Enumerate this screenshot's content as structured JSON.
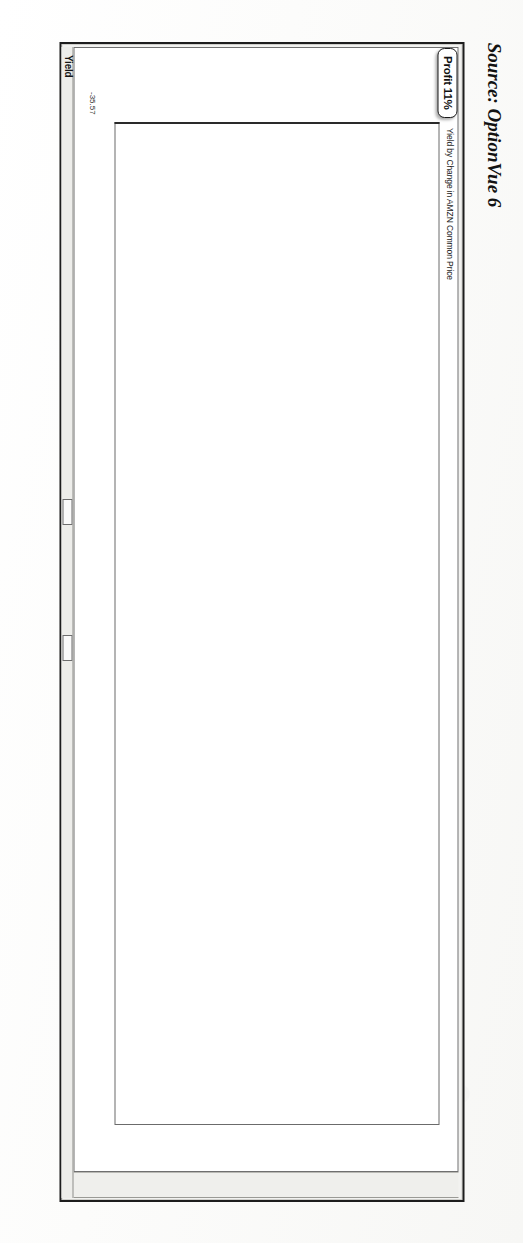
{
  "caption": {
    "source_text": "Source: OptionVue 6"
  },
  "window": {
    "yield_corner_label": "Yield",
    "y_axis_min_value": "-35.57"
  },
  "chart_data": {
    "type": "line",
    "title": "Yield by Change in AMZN Common Price",
    "xlabel": "",
    "ylabel": "Yield",
    "grid": true,
    "legend_position": "none",
    "x_tick_labels": [
      "128.81",
      "131.11",
      "133.42",
      "135.72",
      "138.02",
      "140.33",
      "142.63",
      "144.94",
      "147.24",
      "149.54",
      "151.85",
      "154.15",
      "156.46",
      "158.76",
      "161.06",
      "163.37",
      "165.67",
      "167.98",
      "170.28",
      "172.58",
      "174.89",
      "177.19"
    ],
    "x_secondary_tick_labels": [
      "-25%",
      "-18%",
      "-12%",
      "-6%",
      "-1%",
      "3%",
      "7%",
      "9%",
      "11%",
      "12%",
      "12%",
      "12%",
      "10%",
      "8%",
      "5%",
      "2%",
      "-2%",
      "-7%",
      "-13%",
      "-18%",
      "-24%",
      "-30%"
    ],
    "y_tick_labels": [
      "22%",
      "18%",
      "13%",
      "9%",
      "5%",
      "0%",
      "-5%",
      "-9%",
      "-13%",
      "-18%",
      "-22%",
      "-27%",
      "-32%"
    ],
    "ylim": [
      -35.57,
      24.0
    ],
    "xlim": [
      128.81,
      177.19
    ],
    "annotations": [
      {
        "label": "Profit 11%",
        "x": 147.24,
        "y": 11.0
      }
    ],
    "series": [
      {
        "name": "At expiration",
        "style": "solid",
        "x": [
          128.81,
          131.11,
          133.42,
          135.72,
          138.02,
          140.33,
          142.63,
          144.94,
          147.24,
          149.54,
          151.85,
          154.15,
          156.46,
          158.76,
          161.06,
          163.37,
          165.67,
          167.98,
          170.28,
          172.58,
          174.89,
          177.19
        ],
        "values": [
          -32.0,
          -0.4,
          -0.4,
          -0.4,
          -0.4,
          -0.4,
          -0.4,
          -0.4,
          -0.4,
          -0.4,
          -0.4,
          -0.4,
          -0.4,
          -0.4,
          -0.4,
          -0.4,
          -0.4,
          -0.4,
          -0.4,
          -0.4,
          -0.4,
          -0.4
        ]
      },
      {
        "name": "At expiration upper",
        "style": "solid",
        "x": [
          128.81,
          131.11,
          133.42,
          135.72,
          138.02,
          140.33,
          142.63,
          144.94,
          147.24,
          149.54,
          151.85,
          154.15,
          156.46,
          158.76,
          161.06,
          163.37,
          165.67,
          167.98,
          170.28,
          172.58,
          174.89,
          177.19
        ],
        "values": [
          22.0,
          22.0,
          22.0,
          22.0,
          22.0,
          22.0,
          22.0,
          22.0,
          22.0,
          22.0,
          22.0,
          22.0,
          22.0,
          22.0,
          22.0,
          22.0,
          22.0,
          22.0,
          22.0,
          20.2,
          18.8,
          18.8
        ]
      },
      {
        "name": "Theoretical curve (long dash)",
        "style": "dashed",
        "x": [
          128.81,
          131.11,
          133.42,
          135.72,
          138.02,
          140.33,
          142.63,
          144.94,
          147.24,
          149.54,
          151.85,
          154.15,
          156.46,
          158.76,
          161.06,
          163.37,
          165.67,
          167.98,
          170.28,
          172.58,
          174.89,
          177.19
        ],
        "values": [
          -32.0,
          -27.5,
          -23.0,
          -18.5,
          -14.0,
          -9.5,
          -5.0,
          -1.0,
          2.5,
          5.5,
          8.0,
          10.0,
          11.5,
          12.5,
          13.2,
          13.3,
          12.5,
          10.5,
          6.5,
          1.0,
          -8.0,
          -20.0
        ]
      },
      {
        "name": "Theoretical curve (dotted)",
        "style": "dotted",
        "x": [
          128.81,
          131.11,
          133.42,
          135.72,
          138.02,
          140.33,
          142.63,
          144.94,
          147.24,
          149.54,
          151.85,
          154.15,
          156.46,
          158.76,
          161.06,
          163.37,
          165.67,
          167.98,
          170.28,
          172.58,
          174.89,
          177.19
        ],
        "values": [
          -35.0,
          -31.0,
          -26.5,
          -22.0,
          -17.5,
          -13.0,
          -8.5,
          -4.5,
          -1.0,
          2.0,
          4.5,
          6.5,
          8.0,
          9.0,
          9.4,
          9.2,
          8.0,
          5.8,
          2.0,
          -3.5,
          -12.5,
          -24.0
        ]
      },
      {
        "name": "Zero reference line",
        "style": "dotted-vertical",
        "x": [
          147.24
        ],
        "values": [
          0
        ]
      }
    ]
  }
}
